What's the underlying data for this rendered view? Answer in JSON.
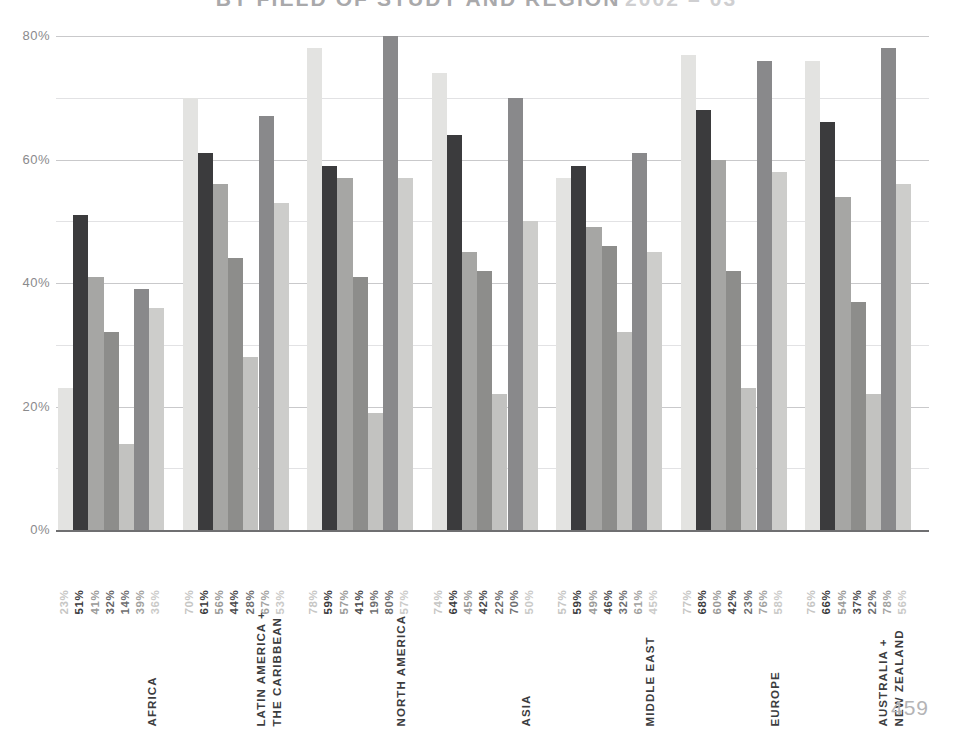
{
  "title": {
    "main": "BY FIELD OF STUDY AND REGION",
    "years": "2002 – 03"
  },
  "page_number": "459",
  "axis": {
    "y_ticks": [
      "80%",
      "60%",
      "40%",
      "20%",
      "0%"
    ]
  },
  "chart_data": {
    "type": "bar",
    "title": "BY FIELD OF STUDY AND REGION 2002 – 03",
    "xlabel": "",
    "ylabel": "",
    "ylim": [
      0,
      80
    ],
    "grid": true,
    "grid_major_step": 20,
    "grid_minor_step": 10,
    "legend_position": "none",
    "categories": [
      "AFRICA",
      "LATIN AMERICA + THE CARIBBEAN",
      "NORTH AMERICA",
      "ASIA",
      "MIDDLE EAST",
      "EUROPE",
      "AUSTRALIA + NEW ZEALAND"
    ],
    "series": [
      {
        "name": "Field 1",
        "color": "#e3e3e1",
        "values": [
          23,
          70,
          78,
          74,
          57,
          77,
          76
        ]
      },
      {
        "name": "Field 2",
        "color": "#3b3b3d",
        "values": [
          51,
          61,
          59,
          64,
          59,
          68,
          66
        ]
      },
      {
        "name": "Field 3",
        "color": "#a6a6a4",
        "values": [
          41,
          56,
          57,
          45,
          49,
          60,
          54
        ]
      },
      {
        "name": "Field 4",
        "color": "#8d8d8b",
        "values": [
          32,
          44,
          41,
          42,
          46,
          42,
          37
        ]
      },
      {
        "name": "Field 5",
        "color": "#c2c2c0",
        "values": [
          14,
          28,
          19,
          22,
          32,
          23,
          22
        ]
      },
      {
        "name": "Field 6",
        "color": "#89898b",
        "values": [
          39,
          67,
          80,
          70,
          61,
          76,
          78
        ]
      },
      {
        "name": "Field 7",
        "color": "#cdcdcb",
        "values": [
          36,
          53,
          57,
          50,
          45,
          58,
          56
        ]
      }
    ],
    "groups": [
      {
        "label": "AFRICA",
        "label_lines": [
          "AFRICA"
        ],
        "bars": [
          {
            "value": 23,
            "label": "23%",
            "color": "#e3e3e1",
            "label_color": "#c6c6c4"
          },
          {
            "value": 51,
            "label": "51%",
            "color": "#3b3b3d",
            "label_color": "#3b3b3d"
          },
          {
            "value": 41,
            "label": "41%",
            "color": "#a6a6a4",
            "label_color": "#9a9a98"
          },
          {
            "value": 32,
            "label": "32%",
            "color": "#8d8d8b",
            "label_color": "#666668"
          },
          {
            "value": 14,
            "label": "14%",
            "color": "#c2c2c0",
            "label_color": "#6e6e70"
          },
          {
            "value": 39,
            "label": "39%",
            "color": "#89898b",
            "label_color": "#a2a2a0"
          },
          {
            "value": 36,
            "label": "36%",
            "color": "#cdcdcb",
            "label_color": "#cacac8"
          }
        ]
      },
      {
        "label": "LATIN AMERICA + THE CARIBBEAN",
        "label_lines": [
          "LATIN AMERICA +",
          "THE CARIBBEAN"
        ],
        "bars": [
          {
            "value": 70,
            "label": "70%",
            "color": "#e3e3e1",
            "label_color": "#c6c6c4"
          },
          {
            "value": 61,
            "label": "61%",
            "color": "#3b3b3d",
            "label_color": "#3b3b3d"
          },
          {
            "value": 56,
            "label": "56%",
            "color": "#a6a6a4",
            "label_color": "#9a9a98"
          },
          {
            "value": 44,
            "label": "44%",
            "color": "#8d8d8b",
            "label_color": "#4a4a4c"
          },
          {
            "value": 28,
            "label": "28%",
            "color": "#c2c2c0",
            "label_color": "#6e6e70"
          },
          {
            "value": 67,
            "label": "67%",
            "color": "#89898b",
            "label_color": "#a2a2a0"
          },
          {
            "value": 53,
            "label": "53%",
            "color": "#cdcdcb",
            "label_color": "#cacac8"
          }
        ]
      },
      {
        "label": "NORTH AMERICA",
        "label_lines": [
          "NORTH AMERICA"
        ],
        "bars": [
          {
            "value": 78,
            "label": "78%",
            "color": "#e3e3e1",
            "label_color": "#c6c6c4"
          },
          {
            "value": 59,
            "label": "59%",
            "color": "#3b3b3d",
            "label_color": "#3b3b3d"
          },
          {
            "value": 57,
            "label": "57%",
            "color": "#a6a6a4",
            "label_color": "#9a9a98"
          },
          {
            "value": 41,
            "label": "41%",
            "color": "#8d8d8b",
            "label_color": "#4a4a4c"
          },
          {
            "value": 19,
            "label": "19%",
            "color": "#c2c2c0",
            "label_color": "#6e6e70"
          },
          {
            "value": 80,
            "label": "80%",
            "color": "#89898b",
            "label_color": "#6e6e70"
          },
          {
            "value": 57,
            "label": "57%",
            "color": "#cdcdcb",
            "label_color": "#cacac8"
          }
        ]
      },
      {
        "label": "ASIA",
        "label_lines": [
          "ASIA"
        ],
        "bars": [
          {
            "value": 74,
            "label": "74%",
            "color": "#e3e3e1",
            "label_color": "#c6c6c4"
          },
          {
            "value": 64,
            "label": "64%",
            "color": "#3b3b3d",
            "label_color": "#3b3b3d"
          },
          {
            "value": 45,
            "label": "45%",
            "color": "#a6a6a4",
            "label_color": "#9a9a98"
          },
          {
            "value": 42,
            "label": "42%",
            "color": "#8d8d8b",
            "label_color": "#4a4a4c"
          },
          {
            "value": 22,
            "label": "22%",
            "color": "#c2c2c0",
            "label_color": "#6e6e70"
          },
          {
            "value": 70,
            "label": "70%",
            "color": "#89898b",
            "label_color": "#6e6e70"
          },
          {
            "value": 50,
            "label": "50%",
            "color": "#cdcdcb",
            "label_color": "#cacac8"
          }
        ]
      },
      {
        "label": "MIDDLE EAST",
        "label_lines": [
          "MIDDLE EAST"
        ],
        "bars": [
          {
            "value": 57,
            "label": "57%",
            "color": "#e3e3e1",
            "label_color": "#c6c6c4"
          },
          {
            "value": 59,
            "label": "59%",
            "color": "#3b3b3d",
            "label_color": "#3b3b3d"
          },
          {
            "value": 49,
            "label": "49%",
            "color": "#a6a6a4",
            "label_color": "#9a9a98"
          },
          {
            "value": 46,
            "label": "46%",
            "color": "#8d8d8b",
            "label_color": "#4a4a4c"
          },
          {
            "value": 32,
            "label": "32%",
            "color": "#c2c2c0",
            "label_color": "#6e6e70"
          },
          {
            "value": 61,
            "label": "61%",
            "color": "#89898b",
            "label_color": "#a2a2a0"
          },
          {
            "value": 45,
            "label": "45%",
            "color": "#cdcdcb",
            "label_color": "#cacac8"
          }
        ]
      },
      {
        "label": "EUROPE",
        "label_lines": [
          "EUROPE"
        ],
        "bars": [
          {
            "value": 77,
            "label": "77%",
            "color": "#e3e3e1",
            "label_color": "#c6c6c4"
          },
          {
            "value": 68,
            "label": "68%",
            "color": "#3b3b3d",
            "label_color": "#3b3b3d"
          },
          {
            "value": 60,
            "label": "60%",
            "color": "#a6a6a4",
            "label_color": "#9a9a98"
          },
          {
            "value": 42,
            "label": "42%",
            "color": "#8d8d8b",
            "label_color": "#4a4a4c"
          },
          {
            "value": 23,
            "label": "23%",
            "color": "#c2c2c0",
            "label_color": "#6e6e70"
          },
          {
            "value": 76,
            "label": "76%",
            "color": "#89898b",
            "label_color": "#a2a2a0"
          },
          {
            "value": 58,
            "label": "58%",
            "color": "#cdcdcb",
            "label_color": "#cacac8"
          }
        ]
      },
      {
        "label": "AUSTRALIA + NEW ZEALAND",
        "label_lines": [
          "AUSTRALIA +",
          "NEW ZEALAND"
        ],
        "bars": [
          {
            "value": 76,
            "label": "76%",
            "color": "#e3e3e1",
            "label_color": "#c6c6c4"
          },
          {
            "value": 66,
            "label": "66%",
            "color": "#3b3b3d",
            "label_color": "#3b3b3d"
          },
          {
            "value": 54,
            "label": "54%",
            "color": "#a6a6a4",
            "label_color": "#9a9a98"
          },
          {
            "value": 37,
            "label": "37%",
            "color": "#8d8d8b",
            "label_color": "#4a4a4c"
          },
          {
            "value": 22,
            "label": "22%",
            "color": "#c2c2c0",
            "label_color": "#6e6e70"
          },
          {
            "value": 78,
            "label": "78%",
            "color": "#89898b",
            "label_color": "#a2a2a0"
          },
          {
            "value": 56,
            "label": "56%",
            "color": "#cdcdcb",
            "label_color": "#cacac8"
          }
        ]
      }
    ]
  }
}
